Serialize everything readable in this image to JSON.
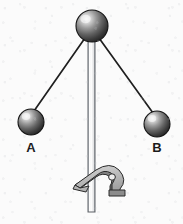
{
  "figure": {
    "background_color": "#fbfbfb",
    "width": 183,
    "height": 224
  },
  "labels": {
    "sphere_a": "A",
    "sphere_b": "B"
  },
  "colors": {
    "sphere_dark": "#2b2b2b",
    "sphere_mid": "#6e6e6e",
    "sphere_highlight": "#efefef",
    "sphere_outline": "#141414",
    "rod_fill": "#f7f7f7",
    "rod_outline": "#5f6368",
    "string": "#1f1f1f",
    "arrow_light": "#c9c9c9",
    "arrow_mid": "#9a9a9a",
    "arrow_dark": "#6b6b6b",
    "arrow_outline": "#2a2a2a",
    "label_color": "#1b1b1b"
  },
  "geometry": {
    "pivot_sphere": {
      "cx": 92,
      "cy": 26,
      "r": 16
    },
    "sphere_a": {
      "cx": 31,
      "cy": 122,
      "r": 13
    },
    "sphere_b": {
      "cx": 157,
      "cy": 124,
      "r": 13
    },
    "rod": {
      "x": 88,
      "y_top": 26,
      "y_bottom": 212,
      "width": 7
    },
    "string_a": {
      "x1": 85,
      "y1": 38,
      "x2": 34,
      "y2": 111
    },
    "string_b": {
      "x1": 99,
      "y1": 38,
      "x2": 153,
      "y2": 113
    },
    "label_a": {
      "x": 31,
      "y": 152
    },
    "label_b": {
      "x": 157,
      "y": 152
    },
    "rotation_arrow": {
      "cx": 101,
      "cy": 180,
      "direction": "clockwise-around-rod"
    }
  }
}
